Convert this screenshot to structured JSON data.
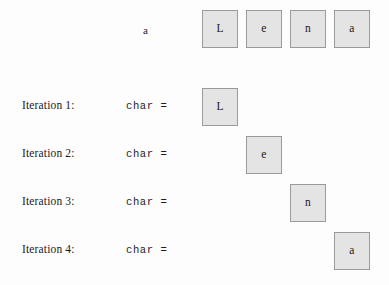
{
  "figure": {
    "background_color": "#fdfdfd",
    "box_fill_color": "#e4e4e4",
    "box_border_color": "#9b9b9b",
    "text_color": "#1c1c1c"
  },
  "header": {
    "variable_label": "a",
    "cells": [
      {
        "char": "L"
      },
      {
        "char": "e"
      },
      {
        "char": "n"
      },
      {
        "char": "a"
      }
    ]
  },
  "rows": [
    {
      "label": "Iteration 1:",
      "assignment": "char  =",
      "char": "L",
      "column": 0
    },
    {
      "label": "Iteration 2:",
      "assignment": "char  =",
      "char": "e",
      "column": 1
    },
    {
      "label": "Iteration 3:",
      "assignment": "char  =",
      "char": "n",
      "column": 2
    },
    {
      "label": "Iteration 4:",
      "assignment": "char  =",
      "char": "a",
      "column": 3
    }
  ],
  "layout": {
    "grid_origin_x": 202,
    "column_pitch": 44,
    "header_row_y": 10,
    "row_start_y": 88,
    "row_pitch": 48,
    "label_x": 22,
    "assignment_x": 126,
    "variable_label_x": 143,
    "variable_label_y": 24
  }
}
